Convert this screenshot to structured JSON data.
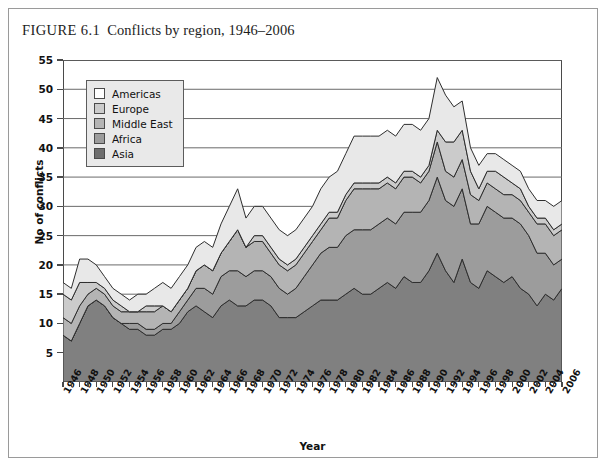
{
  "figure": {
    "number": "FIGURE 6.1",
    "caption": "Conflicts by region, 1946–2006"
  },
  "chart_data": {
    "type": "area",
    "stacked": true,
    "title": "Conflicts by region, 1946–2006",
    "xlabel": "Year",
    "ylabel": "No of conflicts",
    "xlim": [
      1946,
      2006
    ],
    "ylim": [
      0,
      55
    ],
    "ytick_labels": [
      "5",
      "10",
      "15",
      "20",
      "25",
      "30",
      "35",
      "40",
      "45",
      "50",
      "55"
    ],
    "yticks": [
      5,
      10,
      15,
      20,
      25,
      30,
      35,
      40,
      45,
      50,
      55
    ],
    "grid": "horizontal",
    "legend_position": "top-left-inside",
    "x": [
      1946,
      1947,
      1948,
      1949,
      1950,
      1951,
      1952,
      1953,
      1954,
      1955,
      1956,
      1957,
      1958,
      1959,
      1960,
      1961,
      1962,
      1963,
      1964,
      1965,
      1966,
      1967,
      1968,
      1969,
      1970,
      1971,
      1972,
      1973,
      1974,
      1975,
      1976,
      1977,
      1978,
      1979,
      1980,
      1981,
      1982,
      1983,
      1984,
      1985,
      1986,
      1987,
      1988,
      1989,
      1990,
      1991,
      1992,
      1993,
      1994,
      1995,
      1996,
      1997,
      1998,
      1999,
      2000,
      2001,
      2002,
      2003,
      2004,
      2005,
      2006
    ],
    "xtick_labels": [
      "1946",
      "1948",
      "1950",
      "1952",
      "1954",
      "1956",
      "1958",
      "1960",
      "1962",
      "1964",
      "1966",
      "1968",
      "1970",
      "1972",
      "1974",
      "1976",
      "1978",
      "1980",
      "1982",
      "1984",
      "1986",
      "1988",
      "1990",
      "1992",
      "1994",
      "1996",
      "1998",
      "2000",
      "2002",
      "2004",
      "2006"
    ],
    "series": [
      {
        "name": "Asia",
        "color": "#808080",
        "order": 1,
        "values": [
          8,
          7,
          10,
          13,
          14,
          13,
          11,
          10,
          9,
          9,
          8,
          8,
          9,
          9,
          10,
          12,
          13,
          12,
          11,
          13,
          14,
          13,
          13,
          14,
          14,
          13,
          11,
          11,
          11,
          12,
          13,
          14,
          14,
          14,
          15,
          16,
          15,
          15,
          16,
          17,
          16,
          18,
          17,
          17,
          19,
          22,
          19,
          17,
          21,
          17,
          16,
          19,
          18,
          17,
          18,
          16,
          15,
          13,
          15,
          14,
          16
        ]
      },
      {
        "name": "Africa",
        "color": "#9c9c9c",
        "order": 2,
        "values": [
          0,
          0,
          0,
          0,
          0,
          0,
          0,
          0,
          1,
          1,
          1,
          1,
          1,
          1,
          2,
          2,
          3,
          4,
          4,
          5,
          5,
          6,
          5,
          5,
          5,
          5,
          5,
          4,
          5,
          6,
          7,
          8,
          9,
          9,
          10,
          10,
          11,
          11,
          11,
          11,
          11,
          11,
          12,
          12,
          12,
          13,
          12,
          13,
          12,
          10,
          11,
          11,
          11,
          11,
          10,
          11,
          10,
          9,
          7,
          6,
          5
        ]
      },
      {
        "name": "Middle East",
        "color": "#b4b4b4",
        "order": 3,
        "values": [
          3,
          3,
          3,
          2,
          2,
          2,
          2,
          2,
          2,
          2,
          3,
          3,
          3,
          2,
          2,
          2,
          3,
          4,
          4,
          4,
          5,
          7,
          5,
          5,
          5,
          4,
          4,
          4,
          4,
          4,
          4,
          4,
          5,
          5,
          6,
          7,
          7,
          7,
          6,
          6,
          6,
          6,
          6,
          5,
          5,
          6,
          5,
          5,
          5,
          5,
          4,
          4,
          4,
          4,
          4,
          4,
          4,
          5,
          5,
          5,
          5
        ]
      },
      {
        "name": "Europe",
        "color": "#cbcbcb",
        "order": 4,
        "values": [
          4,
          4,
          4,
          2,
          1,
          1,
          1,
          1,
          0,
          0,
          1,
          1,
          0,
          0,
          0,
          0,
          0,
          0,
          0,
          0,
          0,
          0,
          0,
          1,
          1,
          1,
          1,
          1,
          1,
          1,
          1,
          1,
          1,
          1,
          1,
          1,
          1,
          1,
          1,
          1,
          1,
          1,
          1,
          1,
          1,
          2,
          5,
          6,
          5,
          4,
          2,
          2,
          3,
          3,
          2,
          2,
          1,
          1,
          1,
          1,
          1
        ]
      },
      {
        "name": "Americas",
        "color": "#e8e8e8",
        "order": 5,
        "values": [
          2,
          2,
          4,
          4,
          3,
          2,
          2,
          2,
          2,
          3,
          2,
          3,
          4,
          4,
          4,
          4,
          4,
          4,
          4,
          5,
          6,
          7,
          5,
          5,
          5,
          5,
          5,
          5,
          5,
          5,
          5,
          6,
          6,
          7,
          7,
          8,
          8,
          8,
          8,
          8,
          8,
          8,
          8,
          8,
          8,
          9,
          8,
          6,
          5,
          4,
          4,
          3,
          3,
          3,
          3,
          3,
          3,
          3,
          3,
          4,
          4
        ]
      }
    ],
    "totals": [
      17,
      16,
      21,
      21,
      20,
      18,
      16,
      15,
      14,
      15,
      15,
      16,
      17,
      16,
      18,
      20,
      23,
      24,
      23,
      27,
      30,
      33,
      28,
      30,
      30,
      28,
      26,
      25,
      26,
      28,
      30,
      33,
      35,
      36,
      39,
      42,
      42,
      42,
      42,
      43,
      42,
      44,
      44,
      43,
      45,
      52,
      49,
      47,
      48,
      40,
      37,
      39,
      39,
      38,
      37,
      36,
      33,
      31,
      31,
      30,
      31
    ]
  },
  "legend": {
    "entries": [
      {
        "label": "Americas",
        "color": "#ffffff"
      },
      {
        "label": "Europe",
        "color": "#cbcbcb"
      },
      {
        "label": "Middle East",
        "color": "#b4b4b4"
      },
      {
        "label": "Africa",
        "color": "#9c9c9c"
      },
      {
        "label": "Asia",
        "color": "#6e6e6e"
      }
    ]
  },
  "colors": {
    "axis": "#4a4a4a",
    "grid": "#6a6a6a",
    "outline": "#2e2e2e",
    "frame": "#9a9a9a",
    "legend_bg": "#e9e9e9"
  }
}
